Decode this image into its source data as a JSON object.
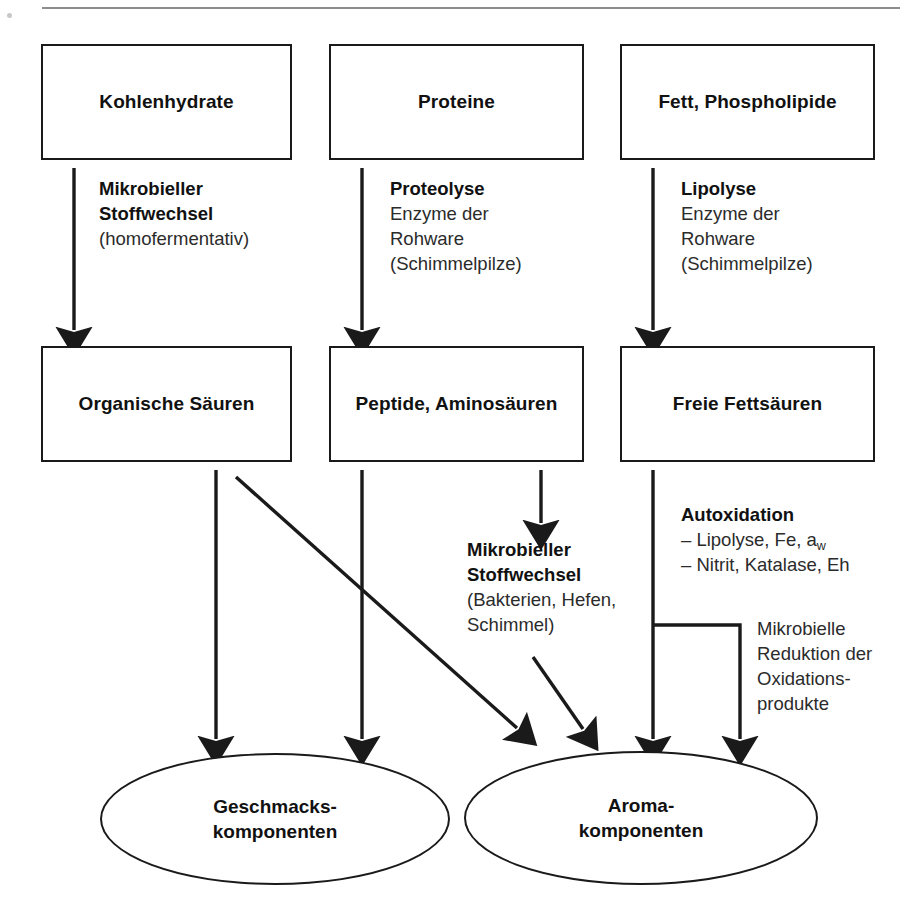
{
  "diagram": {
    "colors": {
      "stroke": "#1a1a1a",
      "text": "#111111",
      "annotation_text": "#2b2b2b",
      "rule": "#8c8c8c",
      "background": "#ffffff"
    },
    "top_rule": {
      "x": 42,
      "y": 7,
      "width": 858,
      "height": 2
    },
    "substrates": [
      {
        "id": "kohlenhydrate",
        "label": "Kohlenhydrate",
        "x": 41,
        "y": 44,
        "w": 251,
        "h": 116
      },
      {
        "id": "proteine",
        "label": "Proteine",
        "x": 329,
        "y": 44,
        "w": 255,
        "h": 116
      },
      {
        "id": "fett-phospholipide",
        "label": "Fett, Phospholipide",
        "x": 620,
        "y": 44,
        "w": 255,
        "h": 116
      }
    ],
    "intermediates": [
      {
        "id": "organische-saeuren",
        "label": "Organische Säuren",
        "x": 41,
        "y": 346,
        "w": 251,
        "h": 116
      },
      {
        "id": "peptide-aminosaeuren",
        "label": "Peptide, Aminosäuren",
        "x": 329,
        "y": 346,
        "w": 255,
        "h": 116
      },
      {
        "id": "freie-fettsaeuren",
        "label": "Freie Fettsäuren",
        "x": 620,
        "y": 346,
        "w": 255,
        "h": 116
      }
    ],
    "products": [
      {
        "id": "geschmackskomponenten",
        "lines": [
          "Geschmacks-",
          "komponenten"
        ],
        "cx": 275,
        "cy": 819,
        "rx": 175,
        "ry": 66
      },
      {
        "id": "aromakomponenten",
        "lines": [
          "Aroma-",
          "komponenten"
        ],
        "cx": 641,
        "cy": 818,
        "rx": 177,
        "ry": 67
      }
    ],
    "annotations": [
      {
        "id": "mikrobieller-stoffwechsel-homofermentativ",
        "x": 99,
        "y": 176,
        "head": [
          "Mikrobieller",
          "Stoffwechsel"
        ],
        "lines": [
          "(homofermentativ)"
        ]
      },
      {
        "id": "proteolyse",
        "x": 390,
        "y": 176,
        "head": [
          "Proteolyse"
        ],
        "lines": [
          "Enzyme der",
          "Rohware",
          "(Schimmelpilze)"
        ]
      },
      {
        "id": "lipolyse",
        "x": 681,
        "y": 176,
        "head": [
          "Lipolyse"
        ],
        "lines": [
          "Enzyme der",
          "Rohware",
          "(Schimmelpilze)"
        ]
      },
      {
        "id": "mikrobieller-stoffwechsel-bakterien",
        "x": 467,
        "y": 537,
        "head": [
          "Mikrobieller",
          "Stoffwechsel"
        ],
        "lines": [
          "(Bakterien, Hefen,",
          "Schimmel)"
        ]
      },
      {
        "id": "autoxidation",
        "x": 681,
        "y": 502,
        "head": [
          "Autoxidation"
        ],
        "lines": [
          "– Lipolyse, Fe, a<sub>w</sub>",
          "– Nitrit, Katalase, Eh"
        ],
        "allow_html": true
      },
      {
        "id": "mikrobielle-reduktion",
        "x": 757,
        "y": 616,
        "head": [],
        "lines": [
          "Mikrobielle",
          "Reduktion der",
          "Oxidations-",
          "produkte"
        ]
      }
    ],
    "connectors": [
      {
        "id": "arrow-kohlenhydrate-to-saeuren",
        "type": "vertical-arrow",
        "x": 74,
        "y1": 168,
        "y2": 338
      },
      {
        "id": "arrow-proteine-to-peptide",
        "type": "vertical-arrow",
        "x": 362,
        "y1": 168,
        "y2": 338
      },
      {
        "id": "arrow-fett-to-fettsaeuren",
        "type": "vertical-arrow",
        "x": 653,
        "y1": 168,
        "y2": 338
      },
      {
        "id": "arrow-saeuren-to-geschmack",
        "type": "vertical-arrow",
        "x": 216,
        "y1": 470,
        "y2": 745
      },
      {
        "id": "arrow-peptide-to-geschmack",
        "type": "vertical-arrow",
        "x": 362,
        "y1": 470,
        "y2": 745
      },
      {
        "id": "arrow-saeuren-to-aroma-diagonal",
        "type": "diagonal-arrow",
        "x1": 236,
        "y1": 477,
        "x2": 523,
        "y2": 733
      },
      {
        "id": "arrow-peptide-to-mikrobieller",
        "type": "vertical-arrow",
        "x": 541,
        "y1": 470,
        "y2": 530
      },
      {
        "id": "arrow-mikrobieller-to-aroma",
        "type": "diagonal-arrow",
        "x1": 533,
        "y1": 657,
        "x2": 588,
        "y2": 735
      },
      {
        "id": "arrow-fettsaeuren-to-aroma",
        "type": "vertical-arrow",
        "x": 653,
        "y1": 470,
        "y2": 745
      },
      {
        "id": "branch-oxidationsprodukte-to-aroma",
        "type": "elbow-arrow",
        "x_from": 653,
        "y_branch": 625,
        "x_to": 740,
        "y_end": 745
      }
    ]
  }
}
